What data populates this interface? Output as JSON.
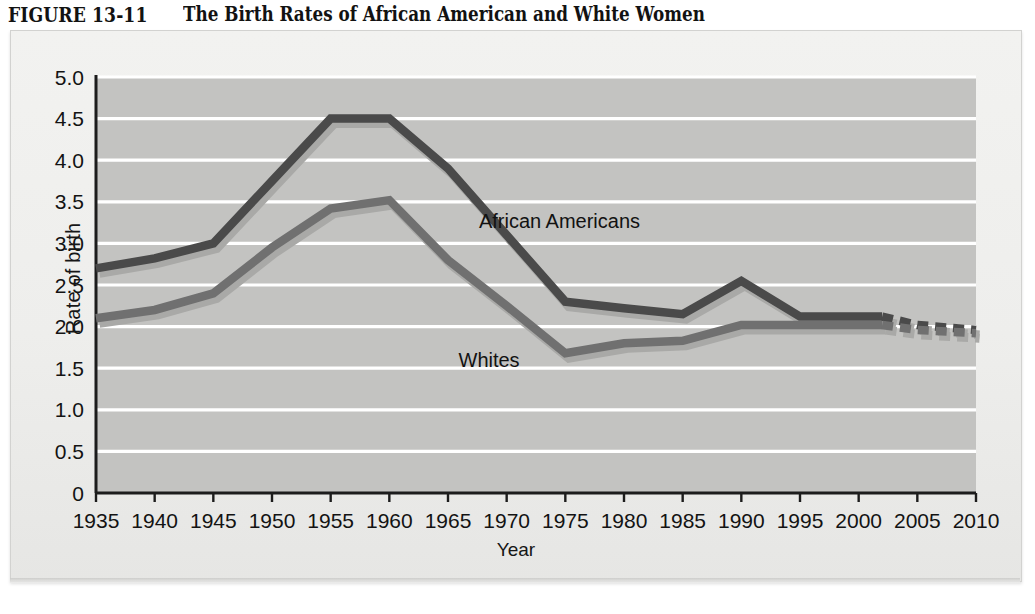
{
  "caption": {
    "figure_label": "FIGURE 13-11",
    "title": "The Birth Rates of African American and White Women"
  },
  "axis_titles": {
    "y": "Rate of birth",
    "x": "Year"
  },
  "colors": {
    "african_american_line": "#4a4a4a",
    "whites_line": "#707070",
    "line_shadow": "#a9a9a7",
    "plot_background": "#c3c3c1",
    "gridline": "#ffffff",
    "axis": "#1c1c1c",
    "panel_background": "#eeeeec",
    "text": "#131313"
  },
  "chart_data": {
    "type": "line",
    "title": "The Birth Rates of African American and White Women",
    "xlabel": "Year",
    "ylabel": "Rate of birth",
    "xlim": [
      1935,
      2010
    ],
    "ylim": [
      0,
      5.0
    ],
    "grid": true,
    "legend_position": "inline-annotations",
    "x_ticks": [
      1935,
      1940,
      1945,
      1950,
      1955,
      1960,
      1965,
      1970,
      1975,
      1980,
      1985,
      1990,
      1995,
      2000,
      2005,
      2010
    ],
    "y_ticks": [
      "0",
      "0.5",
      "1.0",
      "1.5",
      "2.0",
      "2.5",
      "3.0",
      "3.5",
      "4.0",
      "4.5",
      "5.0"
    ],
    "y_tick_values": [
      0,
      0.5,
      1.0,
      1.5,
      2.0,
      2.5,
      3.0,
      3.5,
      4.0,
      4.5,
      5.0
    ],
    "annotations": [
      {
        "text": "African Americans",
        "x": 1974.5,
        "y": 3.18
      },
      {
        "text": "Whites",
        "x": 1968.5,
        "y": 1.52
      }
    ],
    "series": [
      {
        "name": "African Americans",
        "color": "#4a4a4a",
        "solid_x": [
          1935,
          1940,
          1945,
          1950,
          1955,
          1960,
          1965,
          1970,
          1975,
          1980,
          1985,
          1990,
          1995,
          2000,
          2002
        ],
        "solid_values": [
          2.7,
          2.82,
          3.0,
          3.75,
          4.5,
          4.5,
          3.9,
          3.1,
          2.3,
          2.22,
          2.15,
          2.55,
          2.12,
          2.12,
          2.12
        ],
        "projected_x": [
          2002,
          2005,
          2010
        ],
        "projected_values": [
          2.12,
          2.02,
          1.96
        ]
      },
      {
        "name": "Whites",
        "color": "#707070",
        "solid_x": [
          1935,
          1940,
          1945,
          1950,
          1955,
          1960,
          1965,
          1970,
          1975,
          1980,
          1985,
          1990,
          1995,
          2000,
          2002
        ],
        "solid_values": [
          2.1,
          2.2,
          2.4,
          2.95,
          3.42,
          3.52,
          2.8,
          2.25,
          1.68,
          1.8,
          1.83,
          2.02,
          2.02,
          2.02,
          2.02
        ],
        "projected_x": [
          2002,
          2005,
          2010
        ],
        "projected_values": [
          2.02,
          1.96,
          1.92
        ]
      }
    ]
  }
}
